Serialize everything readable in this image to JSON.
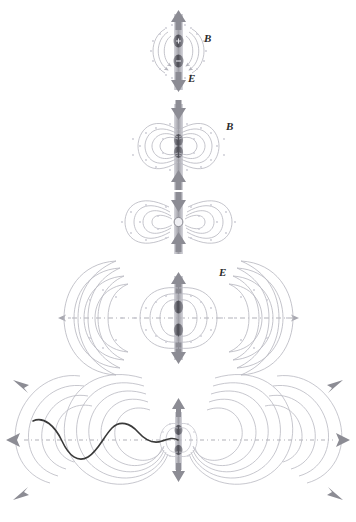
{
  "figure": {
    "background_color": "#ffffff",
    "field_line_color": "#b9b9c2",
    "dot_color": "#c9c9d2",
    "arrow_color": "#8c8c94",
    "wave_color": "#3a3a3a",
    "axis_color": "#a8a8b0",
    "dipole_color": "#6e6e76"
  },
  "labels": {
    "panel1_B": "B",
    "panel1_E": "E",
    "panel2_B": "B",
    "panel4_E": "E"
  },
  "panels": [
    {
      "id": "panel-1",
      "name": "dipole-stage-1",
      "center": [
        178,
        52
      ],
      "description": "Oscillating dipole with circulating magnetic field arrows, vertical E arrows up and down",
      "labels": [
        {
          "text": "B",
          "x": 207,
          "y": 38
        },
        {
          "text": "E",
          "x": 190,
          "y": 78
        }
      ]
    },
    {
      "id": "panel-2",
      "name": "dipole-stage-2",
      "center": [
        178,
        145
      ],
      "description": "Near-field closed loops forming on both sides, arrows pointing inward toward dipole",
      "labels": [
        {
          "text": "B",
          "x": 228,
          "y": 126
        }
      ]
    },
    {
      "id": "panel-3",
      "name": "dipole-stage-3",
      "center": [
        178,
        222
      ],
      "description": "Field loops expanding laterally, pinching at the dipole",
      "labels": []
    },
    {
      "id": "panel-4",
      "name": "dipole-stage-4",
      "center": [
        178,
        318
      ],
      "description": "Detached outer loops plus new inner loops, horizontal dash-dot propagation axis",
      "labels": [
        {
          "text": "E",
          "x": 221,
          "y": 272
        }
      ]
    },
    {
      "id": "panel-5",
      "name": "dipole-stage-5",
      "center": [
        178,
        440
      ],
      "description": "Far-field radiation: multiple detached wavefronts travelling outward with sinusoidal field profile along axis",
      "labels": []
    }
  ],
  "annotations": {
    "propagation_arrows": [
      {
        "name": "arrow-left",
        "direction": "left"
      },
      {
        "name": "arrow-right",
        "direction": "right"
      },
      {
        "name": "arrow-upleft",
        "direction": "up-left"
      },
      {
        "name": "arrow-upright",
        "direction": "up-right"
      },
      {
        "name": "arrow-downleft",
        "direction": "down-left"
      },
      {
        "name": "arrow-downright",
        "direction": "down-right"
      },
      {
        "name": "arrow-up",
        "direction": "up"
      },
      {
        "name": "arrow-down",
        "direction": "down"
      }
    ],
    "sine_wave": {
      "name": "field-amplitude-wave",
      "cycles": 1.6,
      "amplitude": 28
    }
  }
}
